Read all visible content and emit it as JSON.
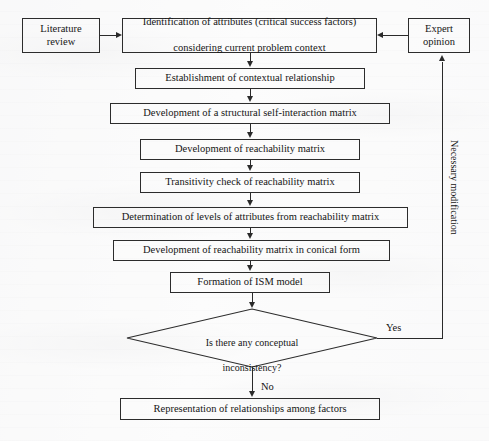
{
  "diagram": {
    "type": "flowchart",
    "nodes": {
      "literature_review": "Literature review",
      "expert_opinion": "Expert opinion",
      "identification": "Identification of attributes (critical success factors) considering current problem context",
      "identification_line1": "Identification of attributes (critical success factors)",
      "identification_line2": "considering current problem context",
      "contextual_relationship": "Establishment of contextual relationship",
      "ssim": "Development of a structural self-interaction matrix",
      "reachability_matrix": "Development of reachability matrix",
      "transitivity_check": "Transitivity check of reachability matrix",
      "levels_determination": "Determination of levels of attributes from reachability matrix",
      "conical_form": "Development of reachability matrix in conical form",
      "ism_model": "Formation of ISM model",
      "decision": "Is there any conceptual inconsistency?",
      "decision_line1": "Is there any conceptual",
      "decision_line2": "inconsistency?",
      "representation": "Representation of relationships among factors"
    },
    "edge_labels": {
      "yes": "Yes",
      "no": "No",
      "feedback_loop": "Necessary modification"
    },
    "colors": {
      "stroke": "#2c2c2c",
      "text": "#151515",
      "background": "#fdfdfd"
    }
  }
}
